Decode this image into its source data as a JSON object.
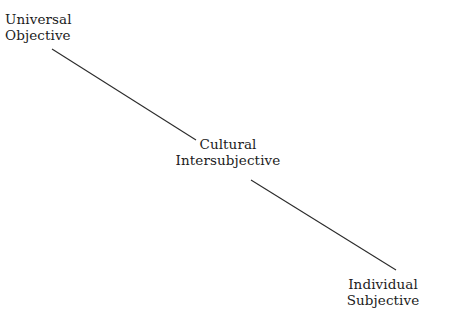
{
  "diagram": {
    "background_color": "#ffffff",
    "text_color": "#1c1c1c",
    "line_color": "#2b2b2b",
    "nodes": [
      {
        "id": "universal",
        "line1": "Universal",
        "line2": "Objective",
        "align": "left"
      },
      {
        "id": "cultural",
        "line1": "Cultural",
        "line2": "Intersubjective",
        "align": "center"
      },
      {
        "id": "individual",
        "line1": "Individual",
        "line2": "Subjective",
        "align": "center"
      }
    ],
    "connectors": [
      {
        "id": "connector-universal-cultural",
        "from": "universal",
        "to": "cultural",
        "x1": 52,
        "y1": 49,
        "x2": 196,
        "y2": 140
      },
      {
        "id": "connector-cultural-individual",
        "from": "cultural",
        "to": "individual",
        "x1": 251,
        "y1": 180,
        "x2": 396,
        "y2": 270
      }
    ]
  }
}
